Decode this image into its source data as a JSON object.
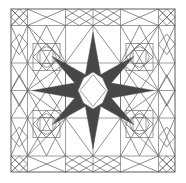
{
  "figure": {
    "title": "Symmetric geometric tile pattern",
    "caption": "",
    "type": "line-drawing",
    "canvas": {
      "width": 186,
      "height": 183
    },
    "colors": {
      "background": "#ffffff",
      "stroke": "#767676",
      "stroke_dark": "#5d5d5d",
      "fill_dark": "#474747",
      "fill_light": "#ffffff"
    },
    "stroke_width": 0.7,
    "frame": {
      "x": 11,
      "y": 9,
      "width": 164,
      "height": 163
    },
    "grid": {
      "description": "Square frame subdivided by straight rules into narrow border bands and larger interior cells; 8-fold symmetric star at center.",
      "x_divisions": [
        11,
        27.5,
        65.5,
        93,
        120.5,
        158.5,
        175
      ],
      "y_divisions": [
        9,
        25.5,
        63,
        90.5,
        118,
        156,
        172
      ],
      "symmetry": "4-fold rotational, mirror on both axes and diagonals"
    },
    "elements": [
      {
        "name": "outer-frame-square",
        "shape": "square",
        "count": 1
      },
      {
        "name": "edge-diamond",
        "shape": "diamond",
        "count": 12
      },
      {
        "name": "corner-diamond",
        "shape": "diamond",
        "count": 4
      },
      {
        "name": "large-diagonal-lattice",
        "shape": "polyline",
        "count": 8
      },
      {
        "name": "quadrant-motif",
        "shape": "square-in-square-in-octagon",
        "count": 4
      },
      {
        "name": "center-star",
        "shape": "8-pointed-star",
        "count": 1,
        "fill": "#474747"
      },
      {
        "name": "center-octagon",
        "shape": "octagon",
        "count": 1,
        "fill": "#ffffff"
      }
    ],
    "labels": {
      "star_points": 8,
      "motifs": 4
    }
  }
}
